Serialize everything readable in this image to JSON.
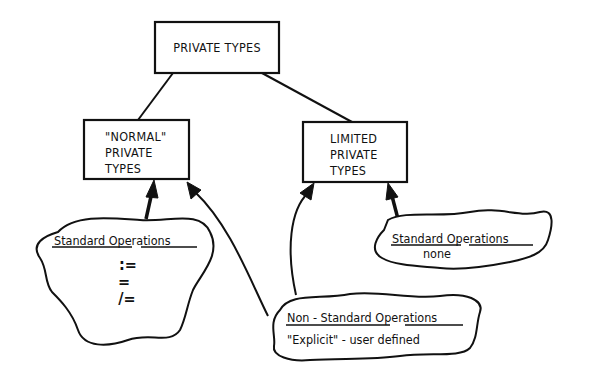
{
  "diagram": {
    "nodes": {
      "root": {
        "label": "PRIVATE TYPES"
      },
      "normal": {
        "lines": [
          "\"NORMAL\"",
          "PRIVATE",
          "TYPES"
        ]
      },
      "limited": {
        "lines": [
          "LIMITED",
          "PRIVATE",
          "TYPES"
        ]
      }
    },
    "clouds": {
      "standard_normal": {
        "heading": "Standard Operations",
        "ops": [
          ":=",
          "=",
          "/="
        ]
      },
      "standard_limited": {
        "heading": "Standard Operations",
        "body": "none"
      },
      "non_standard": {
        "heading": "Non - Standard Operations",
        "body": "\"Explicit\" - user defined"
      }
    },
    "edges": [
      {
        "from": "root",
        "to": "normal",
        "type": "line"
      },
      {
        "from": "root",
        "to": "limited",
        "type": "line"
      },
      {
        "from": "standard_normal",
        "to": "normal",
        "type": "arrow"
      },
      {
        "from": "non_standard",
        "to": "normal",
        "type": "arrow"
      },
      {
        "from": "non_standard",
        "to": "limited",
        "type": "arrow"
      },
      {
        "from": "standard_limited",
        "to": "limited",
        "type": "arrow"
      }
    ],
    "colors": {
      "ink": "#111111",
      "background": "#ffffff"
    }
  }
}
